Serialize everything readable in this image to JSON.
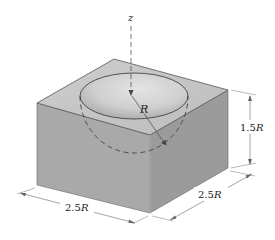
{
  "diagram": {
    "type": "isometric-solid",
    "labels": {
      "axis": "z",
      "radius": "R",
      "height": "1.5R",
      "width_front": "2.5R",
      "depth_right": "2.5R"
    },
    "dimensions": {
      "height_coefficient": "1.5",
      "width_coefficient": "2.5",
      "depth_coefficient": "2.5",
      "unit": "R"
    },
    "colors": {
      "top_face": "#c9c9c9",
      "left_face": "#a9a9a9",
      "right_face": "#9b9b9b",
      "bowl_inner": "#d4d4d4",
      "edge": "#555555",
      "dim_line": "#666666"
    }
  }
}
